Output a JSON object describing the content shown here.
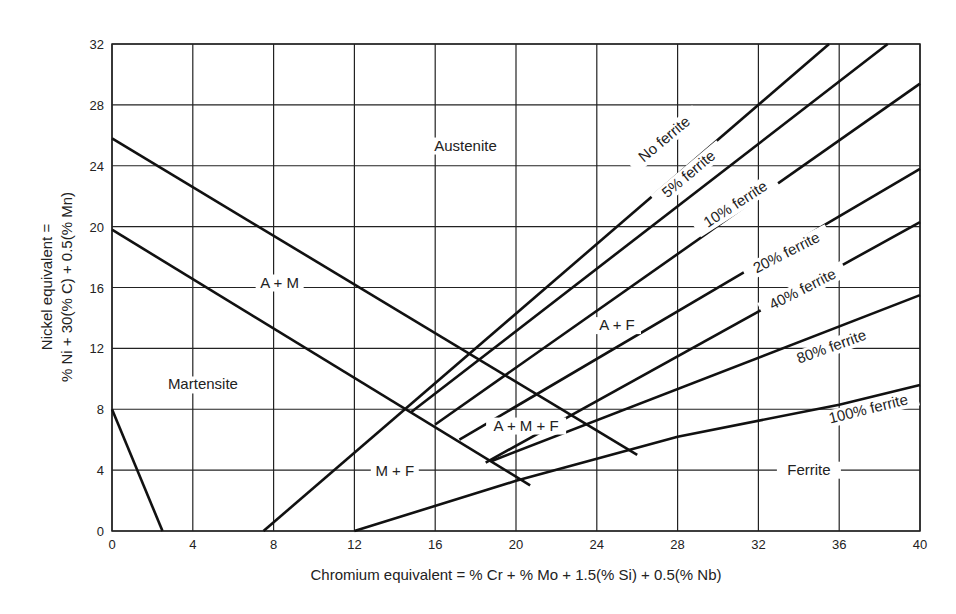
{
  "chart_data": {
    "type": "line",
    "title": "",
    "xlabel": "Chromium equivalent = % Cr + % Mo + 1.5(% Si) + 0.5(% Nb)",
    "ylabel_line1": "Nickel equivalent =",
    "ylabel_line2": "% Ni + 30(% C) + 0.5(% Mn)",
    "xlim": [
      0,
      40
    ],
    "ylim": [
      0,
      32
    ],
    "xticks": [
      0,
      4,
      8,
      12,
      16,
      20,
      24,
      28,
      32,
      36,
      40
    ],
    "yticks": [
      0,
      4,
      8,
      12,
      16,
      20,
      24,
      28,
      32
    ],
    "grid": true,
    "series": [
      {
        "name": "A / A+M boundary",
        "points": [
          [
            0,
            25.8
          ],
          [
            26,
            5
          ]
        ]
      },
      {
        "name": "A+M / M boundary",
        "points": [
          [
            0,
            19.8
          ],
          [
            20.7,
            3
          ]
        ]
      },
      {
        "name": "Martensite limit",
        "points": [
          [
            0,
            8
          ],
          [
            2.5,
            0
          ]
        ]
      },
      {
        "name": "No ferrite",
        "points": [
          [
            7.5,
            0
          ],
          [
            35.5,
            32
          ]
        ]
      },
      {
        "name": "5% ferrite",
        "points": [
          [
            14.8,
            7.8
          ],
          [
            38.4,
            32
          ]
        ]
      },
      {
        "name": "10% ferrite",
        "points": [
          [
            16,
            7
          ],
          [
            40,
            29.4
          ]
        ]
      },
      {
        "name": "20% ferrite",
        "points": [
          [
            17.2,
            6
          ],
          [
            40,
            23.8
          ]
        ]
      },
      {
        "name": "40% ferrite",
        "points": [
          [
            18.5,
            4.5
          ],
          [
            40,
            20.3
          ]
        ]
      },
      {
        "name": "80% ferrite",
        "points": [
          [
            18.8,
            4.6
          ],
          [
            40,
            15.5
          ]
        ]
      },
      {
        "name": "100% ferrite",
        "points": [
          [
            12,
            0
          ],
          [
            20,
            3.3
          ],
          [
            28,
            6.2
          ],
          [
            36,
            8.3
          ],
          [
            40,
            9.6
          ]
        ]
      }
    ],
    "regions": [
      {
        "label": "Austenite",
        "x": 17.5,
        "y": 25
      },
      {
        "label": "A + M",
        "x": 8.3,
        "y": 16
      },
      {
        "label": "Martensite",
        "x": 4.5,
        "y": 9.3
      },
      {
        "label": "A + F",
        "x": 25,
        "y": 13.2
      },
      {
        "label": "A + M + F",
        "x": 20.5,
        "y": 6.6
      },
      {
        "label": "M + F",
        "x": 14,
        "y": 3.6
      },
      {
        "label": "Ferrite",
        "x": 34.5,
        "y": 3.7
      }
    ],
    "line_labels": [
      {
        "label": "No ferrite",
        "x": 27.5,
        "y": 25.5,
        "angle": -40
      },
      {
        "label": "5% ferrite",
        "x": 28.7,
        "y": 23.2,
        "angle": -40
      },
      {
        "label": "10% ferrite",
        "x": 31,
        "y": 21.2,
        "angle": -33
      },
      {
        "label": "20% ferrite",
        "x": 33.5,
        "y": 18,
        "angle": -27
      },
      {
        "label": "40% ferrite",
        "x": 34.3,
        "y": 15.6,
        "angle": -27
      },
      {
        "label": "80% ferrite",
        "x": 35.7,
        "y": 11.8,
        "angle": -20
      },
      {
        "label": "100% ferrite",
        "x": 37.5,
        "y": 7.7,
        "angle": -14
      }
    ]
  }
}
